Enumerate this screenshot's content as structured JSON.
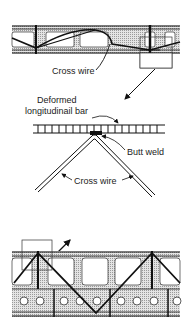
{
  "diagram": {
    "labels": {
      "cross_wire_top": "Cross wire",
      "deformed_line1": "Deformed",
      "deformed_line2": "longitudinail bar",
      "butt_weld": "Butt weld",
      "cross_wire_detail": "Cross wire"
    },
    "colors": {
      "line": "#111111",
      "hatch": "#bdbdbd",
      "background": "#ffffff"
    }
  }
}
